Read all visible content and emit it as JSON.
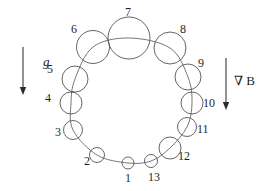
{
  "figure": {
    "background_color": "#ffffff",
    "stroke_color": "#555555",
    "text_color": "#1f1f1f",
    "width": 270,
    "height": 191
  },
  "ring": {
    "center_x": 133,
    "center_y": 96,
    "radius_x": 57,
    "radius_y": 55,
    "description": "Closed loop passing through the centers of all thirteen bubbles"
  },
  "chart_data": {
    "type": "scatter",
    "xlabel": "",
    "ylabel": "",
    "categories": [
      "1",
      "2",
      "3",
      "4",
      "5",
      "6",
      "7",
      "8",
      "9",
      "10",
      "11",
      "12",
      "13"
    ],
    "values": [
      6.0,
      7.5,
      9.5,
      11.0,
      13.0,
      16.5,
      21.0,
      16.0,
      13.0,
      11.0,
      9.5,
      11.0,
      6.5
    ],
    "series": [
      {
        "name": "bubble_radius_px",
        "values": [
          6.0,
          7.5,
          9.5,
          11.0,
          13.0,
          16.5,
          21.0,
          16.0,
          13.0,
          11.0,
          9.5,
          11.0,
          6.5
        ]
      }
    ],
    "points": [
      {
        "label": "1",
        "cx": 128,
        "cy": 163,
        "r": 6.0,
        "label_x": 125,
        "label_y": 172
      },
      {
        "label": "2",
        "cx": 97,
        "cy": 155,
        "r": 7.5,
        "label_x": 84,
        "label_y": 155
      },
      {
        "label": "3",
        "cx": 73,
        "cy": 130,
        "r": 9.5,
        "label_x": 55,
        "label_y": 126
      },
      {
        "label": "4",
        "cx": 71,
        "cy": 103,
        "r": 11.0,
        "label_x": 45,
        "label_y": 92
      },
      {
        "label": "5",
        "cx": 75,
        "cy": 79,
        "r": 13.0,
        "label_x": 47,
        "label_y": 63
      },
      {
        "label": "6",
        "cx": 93,
        "cy": 47,
        "r": 16.5,
        "label_x": 71,
        "label_y": 23
      },
      {
        "label": "7",
        "cx": 129,
        "cy": 38,
        "r": 21.0,
        "label_x": 125,
        "label_y": 6
      },
      {
        "label": "8",
        "cx": 170,
        "cy": 48,
        "r": 16.0,
        "label_x": 180,
        "label_y": 23
      },
      {
        "label": "9",
        "cx": 188,
        "cy": 77,
        "r": 13.0,
        "label_x": 198,
        "label_y": 57
      },
      {
        "label": "10",
        "cx": 192,
        "cy": 103,
        "r": 11.0,
        "label_x": 203,
        "label_y": 97
      },
      {
        "label": "11",
        "cx": 187,
        "cy": 127,
        "r": 9.5,
        "label_x": 197,
        "label_y": 123
      },
      {
        "label": "12",
        "cx": 170,
        "cy": 148,
        "r": 11.0,
        "label_x": 178,
        "label_y": 150
      },
      {
        "label": "13",
        "cx": 151,
        "cy": 161,
        "r": 6.5,
        "label_x": 148,
        "label_y": 171
      }
    ],
    "annotations": [
      {
        "name": "gravity",
        "text": "g",
        "direction": "down",
        "x": 44,
        "y": 50
      },
      {
        "name": "field-gradient",
        "text": "∇ B",
        "direction": "down",
        "x": 228,
        "y": 74
      }
    ],
    "grid": false,
    "legend": "none"
  },
  "labels": {
    "b1": "1",
    "b2": "2",
    "b3": "3",
    "b4": "4",
    "b5": "5",
    "b6": "6",
    "b7": "7",
    "b8": "8",
    "b9": "9",
    "b10": "10",
    "b11": "11",
    "b12": "12",
    "b13": "13"
  },
  "arrows": {
    "gravity": {
      "label": "g",
      "direction": "down",
      "line_x": 23,
      "line_y_start": 47,
      "line_y_end": 95,
      "label_x": 43,
      "label_y": 55
    },
    "field_gradient": {
      "label": "∇ B",
      "direction": "down",
      "line_x": 226,
      "line_y_start": 58,
      "line_y_end": 110,
      "label_x": 234,
      "label_y": 74
    }
  }
}
